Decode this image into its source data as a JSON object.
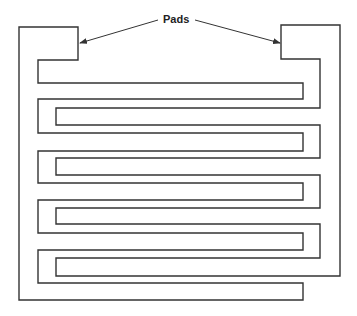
{
  "diagram": {
    "type": "interdigitated comb electrodes",
    "label": "Pads",
    "label_position": {
      "x": 163,
      "y": 14
    },
    "stroke_color": "#333333",
    "left_comb_points": "19,27 78,27 78,60 38,60 38,83 303,83 303,99 38,99 38,133 303,133 303,151 38,151 38,183 303,183 303,200 38,200 38,233 303,233 303,250 38,250 38,283 303,283 303,300 19,300",
    "right_comb_points": "281,25 340,25 340,276 56,276 56,258 320,258 320,224 56,224 56,208 320,208 320,175 56,175 56,158 320,158 320,125 56,125 56,108 320,108 320,59 281,59",
    "arrows": [
      {
        "name": "left-pad-arrow",
        "from": [
          158,
          20
        ],
        "to": [
          80,
          43
        ]
      },
      {
        "name": "right-pad-arrow",
        "from": [
          195,
          20
        ],
        "to": [
          280,
          43
        ]
      }
    ]
  }
}
